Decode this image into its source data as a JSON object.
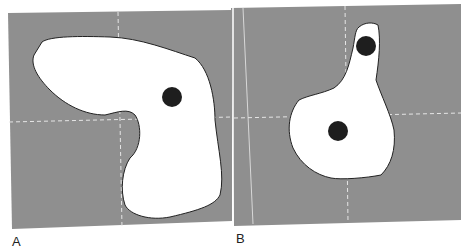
{
  "figure": {
    "background_color": "#8f8f8f",
    "shape_fill": "#ffffff",
    "dot_color": "#1e1e1e",
    "panels": [
      {
        "label": "A",
        "description": "Irregular white region with one dark dot on gray field with dashed crosshair"
      },
      {
        "label": "B",
        "description": "Irregular white region with two dark dots on gray field with dashed crosshair"
      }
    ]
  }
}
